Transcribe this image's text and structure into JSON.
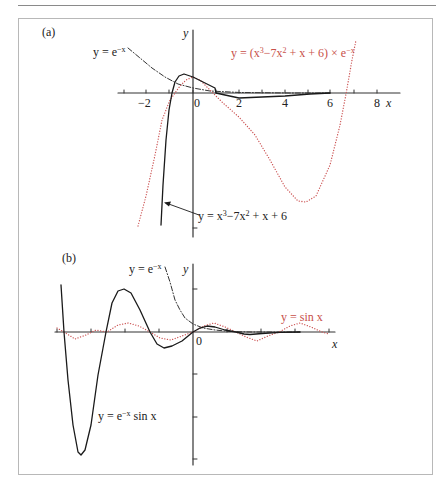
{
  "figure": {
    "colors": {
      "axis": "#333333",
      "black_curve": "#1a1a1a",
      "red_curve": "#cc5555",
      "dashdot": "#333333",
      "frame": "#b8b8b8"
    },
    "panel_a": {
      "label": "(a)",
      "y_axis_label": "y",
      "x_axis_label": "x",
      "x_ticks": [
        "−2",
        "0",
        "2",
        "4",
        "6",
        "8"
      ],
      "labels": {
        "exp": "y = e",
        "exp_sup": "−x",
        "product_prefix": "y = (x",
        "product_sup1": "3",
        "product_mid": "−7x",
        "product_sup2": "2",
        "product_suffix": " + x + 6) × e",
        "product_sup3": "−x",
        "cubic_prefix": "y = x",
        "cubic_sup1": "3",
        "cubic_mid": "−7x",
        "cubic_sup2": "2",
        "cubic_suffix": " + x + 6"
      }
    },
    "panel_b": {
      "label": "(b)",
      "y_axis_label": "y",
      "x_axis_label": "x",
      "origin_label": "0",
      "labels": {
        "exp": "y = e",
        "exp_sup": "−x",
        "sin": "y = sin x",
        "damped_prefix": "y = e",
        "damped_sup": "−x",
        "damped_suffix": " sin x"
      }
    }
  },
  "chart_data": [
    {
      "type": "line",
      "title": "(a)",
      "xlabel": "x",
      "ylabel": "y",
      "xlim": [
        -3.2,
        8.9
      ],
      "x_ticks": [
        -2,
        0,
        2,
        4,
        6,
        8
      ],
      "grid": false,
      "series": [
        {
          "name": "y = e^−x",
          "style": "dash-dot black",
          "x": [
            -2.8,
            -2,
            -1,
            0,
            1,
            2,
            4,
            6
          ],
          "y": [
            16.4,
            7.4,
            2.7,
            1,
            0.37,
            0.14,
            0.02,
            0.0
          ]
        },
        {
          "name": "y = (x³−7x²+x+6) × e^−x (label on red dotted curve)",
          "style": "dotted red",
          "x": [
            -2.4,
            -2,
            -1,
            -0.8,
            0,
            1,
            2,
            3,
            4,
            4.6,
            5,
            6,
            6.8,
            7.2
          ],
          "y": [
            -50.5,
            -32,
            -3,
            0,
            6,
            1,
            -8,
            -21,
            -34,
            -40,
            -39,
            -24,
            0,
            17
          ]
        },
        {
          "name": "y = x³−7x²+x+6 (label on black solid curve)",
          "style": "solid black",
          "x": [
            -1.4,
            -1,
            -0.8,
            -0.4,
            0,
            0.5,
            1,
            1.5,
            2,
            3,
            4,
            6
          ],
          "y": [
            -48,
            -8.2,
            0,
            6.6,
            6,
            3.2,
            0,
            -1.7,
            -1.1,
            -0.8,
            -0.6,
            -0.1
          ]
        }
      ]
    },
    {
      "type": "line",
      "title": "(b)",
      "xlabel": "x",
      "ylabel": "y",
      "grid": false,
      "series": [
        {
          "name": "y = e^−x",
          "style": "dash-dot black"
        },
        {
          "name": "y = sin x",
          "style": "dotted red"
        },
        {
          "name": "y = e^−x sin x",
          "style": "solid black"
        }
      ]
    }
  ],
  "plot_paths": {
    "a_axis_x": [
      [
        118,
        93
      ],
      [
        400,
        93
      ]
    ],
    "a_axis_y": [
      [
        193,
        30
      ],
      [
        193,
        237
      ]
    ],
    "a_xticks_px": [
      124,
      146,
      169,
      193,
      216,
      239,
      262,
      285,
      308,
      330,
      354,
      377
    ],
    "a_exp": [
      [
        128,
        48
      ],
      [
        140,
        58
      ],
      [
        152,
        68
      ],
      [
        165,
        77
      ],
      [
        178,
        84
      ],
      [
        193,
        88
      ],
      [
        210,
        91
      ],
      [
        240,
        92.5
      ],
      [
        290,
        93
      ],
      [
        330,
        93
      ]
    ],
    "a_red": [
      [
        138,
        226
      ],
      [
        146,
        196
      ],
      [
        155,
        155
      ],
      [
        162,
        120
      ],
      [
        170,
        100
      ],
      [
        175,
        93
      ],
      [
        180,
        86
      ],
      [
        186,
        80
      ],
      [
        193,
        77
      ],
      [
        200,
        80
      ],
      [
        208,
        88
      ],
      [
        216,
        96
      ],
      [
        223,
        103
      ],
      [
        239,
        117
      ],
      [
        255,
        135
      ],
      [
        270,
        160
      ],
      [
        285,
        187
      ],
      [
        298,
        201
      ],
      [
        306,
        202
      ],
      [
        316,
        196
      ],
      [
        330,
        165
      ],
      [
        340,
        125
      ],
      [
        346,
        94
      ],
      [
        352,
        60
      ],
      [
        356,
        40
      ]
    ],
    "a_black": [
      [
        161,
        225
      ],
      [
        163,
        185
      ],
      [
        166,
        140
      ],
      [
        169,
        110
      ],
      [
        172,
        93
      ],
      [
        175,
        82
      ],
      [
        179,
        76
      ],
      [
        184,
        74
      ],
      [
        193,
        77
      ],
      [
        203,
        82
      ],
      [
        215,
        88
      ],
      [
        216,
        93
      ],
      [
        225,
        95
      ],
      [
        239,
        98
      ],
      [
        262,
        97
      ],
      [
        285,
        96
      ],
      [
        310,
        94
      ],
      [
        330,
        93
      ]
    ],
    "a_arrow": [
      [
        199,
        215
      ],
      [
        166,
        203
      ]
    ],
    "b_axis_x": [
      [
        55,
        332
      ],
      [
        335,
        332
      ]
    ],
    "b_axis_y": [
      [
        193,
        264
      ],
      [
        193,
        465
      ]
    ],
    "b_xticks_px": [
      57,
      91,
      125,
      159,
      227,
      261,
      295,
      329
    ],
    "b_yticks_px": [
      289,
      374,
      417,
      459
    ],
    "b_exp": [
      [
        165,
        267
      ],
      [
        170,
        282
      ],
      [
        175,
        300
      ],
      [
        180,
        310
      ],
      [
        185,
        318
      ],
      [
        193,
        324
      ],
      [
        203,
        328
      ],
      [
        215,
        330
      ],
      [
        230,
        331.5
      ],
      [
        250,
        332
      ],
      [
        300,
        332
      ]
    ],
    "b_sin": [
      [
        57,
        328
      ],
      [
        64,
        332
      ],
      [
        75,
        339
      ],
      [
        86,
        335
      ],
      [
        96,
        330
      ],
      [
        107,
        332
      ],
      [
        118,
        325
      ],
      [
        128,
        323
      ],
      [
        139,
        326
      ],
      [
        150,
        332
      ],
      [
        160,
        338
      ],
      [
        171,
        340
      ],
      [
        182,
        336
      ],
      [
        193,
        332
      ],
      [
        204,
        326
      ],
      [
        214,
        323
      ],
      [
        225,
        327
      ],
      [
        236,
        332
      ],
      [
        246,
        337
      ],
      [
        257,
        341
      ],
      [
        268,
        336
      ],
      [
        279,
        332
      ],
      [
        290,
        326
      ],
      [
        300,
        323
      ],
      [
        311,
        327
      ],
      [
        322,
        332
      ],
      [
        329,
        334
      ]
    ],
    "b_damped": [
      [
        61,
        285
      ],
      [
        64,
        332
      ],
      [
        68,
        380
      ],
      [
        73,
        425
      ],
      [
        78,
        452
      ],
      [
        81,
        455
      ],
      [
        85,
        450
      ],
      [
        91,
        425
      ],
      [
        98,
        375
      ],
      [
        106,
        332
      ],
      [
        112,
        303
      ],
      [
        118,
        291
      ],
      [
        124,
        289
      ],
      [
        131,
        293
      ],
      [
        140,
        310
      ],
      [
        150,
        332
      ],
      [
        157,
        344
      ],
      [
        164,
        348
      ],
      [
        172,
        346
      ],
      [
        182,
        341
      ],
      [
        193,
        332
      ],
      [
        200,
        328
      ],
      [
        207,
        326
      ],
      [
        215,
        327
      ],
      [
        225,
        330
      ],
      [
        236,
        332
      ],
      [
        244,
        334
      ],
      [
        250,
        334.5
      ],
      [
        262,
        333.5
      ],
      [
        280,
        332.3
      ],
      [
        300,
        332
      ]
    ]
  }
}
